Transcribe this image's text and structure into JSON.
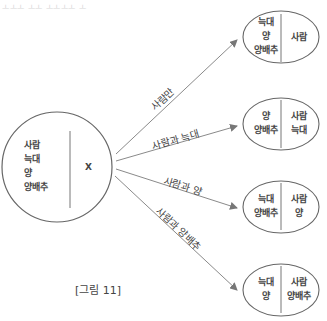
{
  "header": {
    "faint_text": "ㅗㅗㅗ ㅗㅗ ㅗㅗㅗㅗ ㅗ"
  },
  "source": {
    "left": [
      "사람",
      "늑대",
      "양",
      "양배추"
    ],
    "right": [
      "X"
    ]
  },
  "targets": [
    {
      "left": [
        "늑대",
        "양",
        "양배추"
      ],
      "right": [
        "사람"
      ],
      "arrow_label": "사람만"
    },
    {
      "left": [
        "양",
        "양배추"
      ],
      "right": [
        "사람",
        "늑대"
      ],
      "arrow_label": "사람과 늑대"
    },
    {
      "left": [
        "늑대",
        "양배추"
      ],
      "right": [
        "사람",
        "양"
      ],
      "arrow_label": "사람과 양"
    },
    {
      "left": [
        "늑대",
        "양"
      ],
      "right": [
        "사람",
        "양배추"
      ],
      "arrow_label": "사람과 양배추"
    }
  ],
  "caption": "[그림 11]",
  "colors": {
    "line": "#8a8a8a",
    "stroke": "#555555",
    "text": "#444444"
  }
}
